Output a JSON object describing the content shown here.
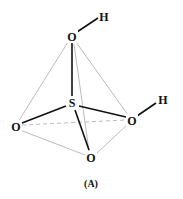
{
  "diagram": {
    "caption": "(A)",
    "atoms": {
      "sulfur": "S",
      "oxygen_top": "O",
      "oxygen_left": "O",
      "oxygen_right": "O",
      "oxygen_bottom": "O",
      "hydrogen_top": "H",
      "hydrogen_right": "H"
    },
    "colors": {
      "bond": "#111111",
      "edge": "#bbbbbb",
      "hidden_edge": "#bbbbbb"
    }
  }
}
